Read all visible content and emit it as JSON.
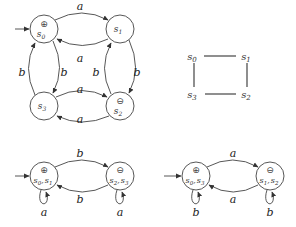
{
  "diagrams": {
    "top_automaton": {
      "states": [
        {
          "id": "s0",
          "label": "s0",
          "marker": "⊕",
          "initial": true
        },
        {
          "id": "s1",
          "label": "s1",
          "marker": ""
        },
        {
          "id": "s2",
          "label": "s2",
          "marker": "⊖"
        },
        {
          "id": "s3",
          "label": "s3",
          "marker": ""
        }
      ],
      "edges": [
        {
          "from": "s0",
          "to": "s1",
          "label": "a"
        },
        {
          "from": "s1",
          "to": "s0",
          "label": "a"
        },
        {
          "from": "s3",
          "to": "s2",
          "label": "a"
        },
        {
          "from": "s2",
          "to": "s3",
          "label": "a"
        },
        {
          "from": "s3",
          "to": "s0",
          "label": "b"
        },
        {
          "from": "s0",
          "to": "s3",
          "label": "b"
        },
        {
          "from": "s2",
          "to": "s1",
          "label": "b"
        },
        {
          "from": "s1",
          "to": "s2",
          "label": "b"
        }
      ]
    },
    "square": {
      "nodes": [
        "s0",
        "s1",
        "s2",
        "s3"
      ],
      "edges": [
        [
          "s0",
          "s1"
        ],
        [
          "s1",
          "s2"
        ],
        [
          "s2",
          "s3"
        ],
        [
          "s3",
          "s0"
        ]
      ]
    },
    "bottom_left": {
      "states": [
        {
          "id": "s0s1",
          "label": "s0, s1",
          "marker": "⊕",
          "initial": true
        },
        {
          "id": "s2s3",
          "label": "s2, s3",
          "marker": "⊖"
        }
      ],
      "edges": [
        {
          "from": "s0s1",
          "to": "s2s3",
          "label": "b"
        },
        {
          "from": "s2s3",
          "to": "s0s1",
          "label": "b"
        },
        {
          "from": "s0s1",
          "to": "s0s1",
          "label": "a"
        },
        {
          "from": "s2s3",
          "to": "s2s3",
          "label": "a"
        }
      ]
    },
    "bottom_right": {
      "states": [
        {
          "id": "s0s3",
          "label": "s0, s3",
          "marker": "⊕",
          "initial": true
        },
        {
          "id": "s1s2",
          "label": "s1, s2",
          "marker": "⊖"
        }
      ],
      "edges": [
        {
          "from": "s0s3",
          "to": "s1s2",
          "label": "a"
        },
        {
          "from": "s1s2",
          "to": "s0s3",
          "label": "a"
        },
        {
          "from": "s0s3",
          "to": "s0s3",
          "label": "b"
        },
        {
          "from": "s1s2",
          "to": "s1s2",
          "label": "b"
        }
      ]
    }
  },
  "text": {
    "a": "a",
    "b": "b",
    "plus": "⊕",
    "minus": "⊖",
    "s": "s",
    "i0": "0",
    "i1": "1",
    "i2": "2",
    "i3": "3",
    "comma": ","
  }
}
